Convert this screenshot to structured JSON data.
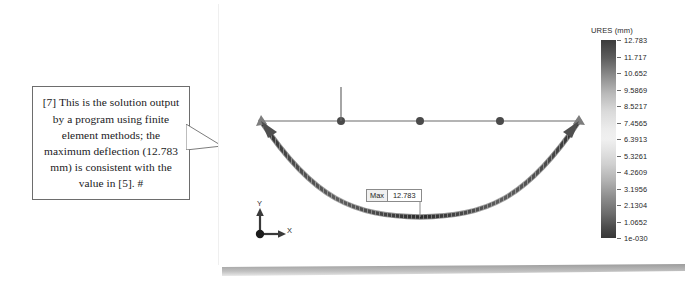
{
  "callout": {
    "name": "annotation-callout",
    "text": "[7] This is the solution output by a program using finite element methods; the maximum deflection (12.783 mm) is consistent with the value in [5].  #"
  },
  "panel": {
    "name": "fea-result-panel",
    "background": "#ffffff"
  },
  "plot": {
    "title_none": "",
    "max_annotation": {
      "label": "Max",
      "value": "12.783"
    },
    "undeformed_nodes": 5,
    "load_indicator": "vertical-force-arrow"
  },
  "colorbar": {
    "title": "URES (mm)",
    "unit": "mm",
    "quantity": "URES",
    "labels": [
      "12.783",
      "11.717",
      "10.652",
      "9.5869",
      "8.5217",
      "7.4565",
      "6.3913",
      "5.3261",
      "4.2609",
      "3.1956",
      "2.1304",
      "1.0652",
      "1e-030"
    ]
  },
  "triad": {
    "y_label": "Y",
    "x_label": "X"
  },
  "chart_data": {
    "type": "line",
    "title": "URES (mm)",
    "xlabel": "X",
    "ylabel": "Y",
    "legend_position": "right",
    "grid": false,
    "colorbar": {
      "quantity": "URES",
      "unit": "mm",
      "min": "1e-030",
      "max": "12.783",
      "ticks": [
        12.783,
        11.717,
        10.652,
        9.5869,
        8.5217,
        7.4565,
        6.3913,
        5.3261,
        4.2609,
        3.1956,
        2.1304,
        1.0652,
        0.0
      ],
      "scale": "linear"
    },
    "annotations": [
      {
        "label": "Max",
        "value": 12.783,
        "x_frac": 0.5
      }
    ],
    "series": [
      {
        "name": "Undeformed beam",
        "type": "line",
        "x": [
          0,
          0.25,
          0.5,
          0.75,
          1
        ],
        "values": [
          0,
          0,
          0,
          0,
          0
        ],
        "markers": "node-dots"
      },
      {
        "name": "Deformed beam (displacement URES)",
        "type": "line",
        "x": [
          0,
          0.05,
          0.1,
          0.15,
          0.2,
          0.25,
          0.3,
          0.35,
          0.4,
          0.45,
          0.5,
          0.55,
          0.6,
          0.65,
          0.7,
          0.75,
          0.8,
          0.85,
          0.9,
          0.95,
          1
        ],
        "values": [
          0.0,
          2.49,
          4.8,
          6.83,
          8.5,
          9.81,
          10.8,
          11.51,
          11.99,
          12.27,
          12.783,
          12.27,
          11.99,
          11.51,
          10.8,
          9.81,
          8.5,
          6.83,
          4.8,
          2.49,
          0.0
        ]
      }
    ],
    "ylim": [
      0,
      12.783
    ],
    "xlim": [
      0,
      1
    ]
  }
}
